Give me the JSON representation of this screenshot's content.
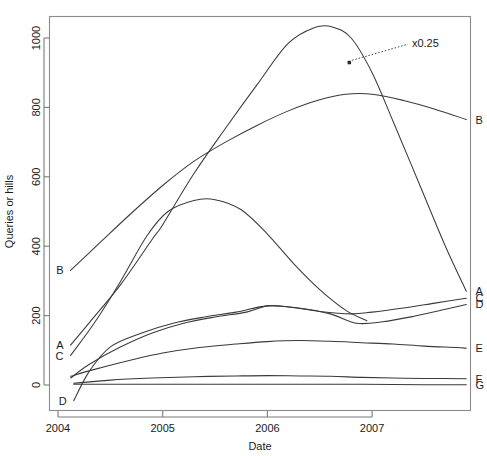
{
  "chart_data": {
    "type": "line",
    "title": "",
    "xlabel": "Date",
    "ylabel": "Queries or hills",
    "xlim": [
      2003.9,
      2008.0
    ],
    "ylim": [
      -60,
      1075
    ],
    "xticks": [
      2004,
      2005,
      2006,
      2007
    ],
    "xticklabels": [
      "2004",
      "2005",
      "2006",
      "2007"
    ],
    "yticks": [
      0,
      200,
      400,
      600,
      800,
      1000
    ],
    "yticklabels": [
      "0",
      "200",
      "400",
      "600",
      "800",
      "1000"
    ],
    "grid": false,
    "legend_position": "inline-endpoint-labels",
    "annotations": [
      {
        "text": "x0.25",
        "x": 2007.38,
        "y": 985,
        "points_to_x": 2006.78,
        "points_to_y": 930,
        "applies_to_series": "A"
      }
    ],
    "series": [
      {
        "name": "A",
        "left_label": "A",
        "right_label": "A",
        "note": "scaled x0.25; rises steeply, peaks mid-2006 then falls steeply",
        "x": [
          2004.12,
          2004.3,
          2004.6,
          2004.9,
          2005.0,
          2005.3,
          2005.6,
          2005.9,
          2006.2,
          2006.45,
          2006.62,
          2006.8,
          2007.0,
          2007.2,
          2007.45,
          2007.7,
          2007.9
        ],
        "y": [
          115,
          180,
          290,
          420,
          462,
          610,
          740,
          865,
          985,
          1030,
          1032,
          1000,
          900,
          760,
          580,
          400,
          270
        ]
      },
      {
        "name": "B",
        "left_label": "B",
        "right_label": "B",
        "x": [
          2004.12,
          2004.4,
          2004.7,
          2005.0,
          2005.3,
          2005.6,
          2005.9,
          2006.2,
          2006.5,
          2006.75,
          2007.0,
          2007.3,
          2007.6,
          2007.9
        ],
        "y": [
          330,
          410,
          495,
          575,
          645,
          700,
          748,
          790,
          822,
          838,
          838,
          820,
          795,
          765
        ]
      },
      {
        "name": "C-upper-hill",
        "left_label": "C",
        "right_label": "",
        "note": "hill curve starting near C label, peaks ~535 in mid-2005, merges down to D region",
        "x": [
          2004.12,
          2004.35,
          2004.6,
          2004.85,
          2005.05,
          2005.3,
          2005.5,
          2005.75,
          2006.0,
          2006.25,
          2006.5,
          2006.75,
          2006.95
        ],
        "y": [
          85,
          180,
          300,
          430,
          500,
          532,
          534,
          505,
          435,
          350,
          275,
          215,
          185
        ]
      },
      {
        "name": "C",
        "left_label": "",
        "right_label": "C",
        "note": "lower flat series rising to ~250",
        "x": [
          2004.12,
          2004.3,
          2004.6,
          2004.9,
          2005.2,
          2005.5,
          2005.8,
          2006.0,
          2006.2,
          2006.5,
          2006.8,
          2007.0,
          2007.3,
          2007.6,
          2007.9
        ],
        "y": [
          20,
          60,
          110,
          150,
          178,
          196,
          210,
          228,
          225,
          212,
          205,
          210,
          222,
          236,
          250
        ]
      },
      {
        "name": "D",
        "left_label": "D",
        "right_label": "D",
        "note": "steep short rise from below zero then flat band ending ~232",
        "x": [
          2004.15,
          2004.3,
          2004.5,
          2004.8,
          2005.1,
          2005.4,
          2005.7,
          2006.0,
          2006.3,
          2006.6,
          2006.85,
          2007.1,
          2007.4,
          2007.7,
          2007.9
        ],
        "y": [
          -45,
          40,
          110,
          150,
          178,
          196,
          210,
          228,
          222,
          205,
          178,
          182,
          198,
          218,
          232
        ]
      },
      {
        "name": "E",
        "left_label": "",
        "right_label": "E",
        "x": [
          2004.12,
          2004.35,
          2004.7,
          2005.0,
          2005.35,
          2005.7,
          2006.0,
          2006.3,
          2006.6,
          2006.9,
          2007.2,
          2007.5,
          2007.8,
          2007.9
        ],
        "y": [
          25,
          45,
          72,
          92,
          108,
          118,
          125,
          128,
          126,
          122,
          118,
          112,
          108,
          106
        ]
      },
      {
        "name": "F",
        "left_label": "",
        "right_label": "F",
        "x": [
          2004.15,
          2004.5,
          2004.9,
          2005.3,
          2005.7,
          2006.0,
          2006.3,
          2006.6,
          2006.9,
          2007.2,
          2007.5,
          2007.9
        ],
        "y": [
          5,
          14,
          20,
          24,
          26,
          27,
          26,
          25,
          22,
          20,
          19,
          18
        ]
      },
      {
        "name": "G",
        "left_label": "",
        "right_label": "G",
        "x": [
          2004.15,
          2004.8,
          2005.5,
          2006.2,
          2006.9,
          2007.5,
          2007.9
        ],
        "y": [
          2,
          2,
          2,
          2,
          2,
          1,
          1
        ]
      }
    ]
  }
}
